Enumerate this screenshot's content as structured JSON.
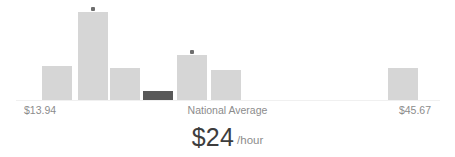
{
  "widget": {
    "name": "pay-range-distribution"
  },
  "headline": {
    "amount": "$24",
    "unit": "/hour"
  },
  "axis": {
    "min_label": "$13.94",
    "average_label": "National Average",
    "max_label": "$45.67"
  },
  "colors": {
    "bar": "#d6d6d6",
    "bar_highlight": "#595959",
    "marker": "#6e6e6e",
    "baseline": "#f0f0f0",
    "label_text": "#8c8c8c",
    "headline_text": "#3d3d3d",
    "background": "#ffffff"
  },
  "chart_data": {
    "type": "bar",
    "title": "",
    "xlabel": "",
    "ylabel": "",
    "grid": false,
    "legend": null,
    "baseline_visible": true,
    "categories": [
      "1",
      "2",
      "3",
      "4",
      "5",
      "6",
      "7"
    ],
    "values": [
      35,
      89,
      33,
      10,
      46,
      31,
      33
    ],
    "ylim": [
      0,
      101
    ],
    "annotations": [
      {
        "label": "$13.94",
        "position": "axis-left"
      },
      {
        "label": "National Average",
        "position": "axis-center"
      },
      {
        "label": "$45.67",
        "position": "axis-right"
      }
    ],
    "bars": [
      {
        "index": 0,
        "x": 42,
        "width": 30,
        "height": 35,
        "highlight": false,
        "marker": false
      },
      {
        "index": 1,
        "x": 78,
        "width": 30,
        "height": 89,
        "highlight": false,
        "marker": true
      },
      {
        "index": 2,
        "x": 110,
        "width": 30,
        "height": 33,
        "highlight": false,
        "marker": false
      },
      {
        "index": 3,
        "x": 143,
        "width": 30,
        "height": 10,
        "highlight": true,
        "marker": false
      },
      {
        "index": 4,
        "x": 177,
        "width": 30,
        "height": 46,
        "highlight": false,
        "marker": true
      },
      {
        "index": 5,
        "x": 211,
        "width": 30,
        "height": 31,
        "highlight": false,
        "marker": false
      },
      {
        "index": 6,
        "x": 388,
        "width": 30,
        "height": 33,
        "highlight": false,
        "marker": false
      }
    ]
  }
}
